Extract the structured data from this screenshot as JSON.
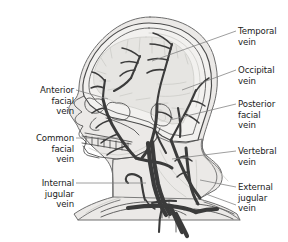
{
  "figure": {
    "view": "lateral",
    "background_color": "#ffffff",
    "colors": {
      "vein": "#3b3b3b",
      "vein_light": "#5a5a5a",
      "bone_outline": "#4a4a4a",
      "bone_fill": "#f2f1ef",
      "brain_fill": "#e6e5e2",
      "brain_line": "#c9c8c4",
      "soft_tissue_fill": "#ebe9e7",
      "soft_tissue_outline": "#6e6e6e",
      "leader_line": "#7d7d7d",
      "label_text": "#1b1b1b"
    }
  },
  "labels": {
    "left": [
      {
        "id": "anterior-facial-vein",
        "lines": [
          "Anterior",
          "facial",
          "vein"
        ],
        "text_x": 74,
        "text_y": 93,
        "leader": "M 76 90 L 108 99"
      },
      {
        "id": "common-facial-vein",
        "lines": [
          "Common",
          "facial",
          "vein"
        ],
        "text_x": 74,
        "text_y": 141,
        "leader": "M 76 138 L 118 138"
      },
      {
        "id": "internal-jugular-vein",
        "lines": [
          "Internal",
          "jugular",
          "vein"
        ],
        "text_x": 74,
        "text_y": 186,
        "leader": "M 76 183 L 146 183"
      }
    ],
    "right": [
      {
        "id": "temporal-vein",
        "lines": [
          "Temporal",
          "vein"
        ],
        "text_x": 238,
        "text_y": 34,
        "leader": "M 236 31 L 152 61"
      },
      {
        "id": "occipital-vein",
        "lines": [
          "Occipital",
          "vein"
        ],
        "text_x": 238,
        "text_y": 73,
        "leader": "M 236 70 L 182 90"
      },
      {
        "id": "posterior-facial-vein",
        "lines": [
          "Posterior",
          "facial",
          "vein"
        ],
        "text_x": 238,
        "text_y": 107,
        "leader": "M 236 104 L 170 120"
      },
      {
        "id": "vertebral-vein",
        "lines": [
          "Vertebral",
          "vein"
        ],
        "text_x": 238,
        "text_y": 154,
        "leader": "M 236 151 L 172 159"
      },
      {
        "id": "external-jugular-vein",
        "lines": [
          "External",
          "jugular",
          "vein"
        ],
        "text_x": 238,
        "text_y": 190,
        "leader": "M 236 187 L 200 180",
        "leader2": "M 236 205 L 206 194"
      }
    ]
  },
  "anatomy": {
    "head_outline_outer": "M 150 17 C 183 17 207 33 214 57 C 220 78 217 96 212 110 C 208 123 205 131 203 139 C 201 147 203 152 207 156 C 213 161 219 165 221 171 C 224 179 221 186 215 190 L 206 195 L 199 199 C 214 203 228 208 237 214 L 240 220 L 78 220 L 74 214 C 84 207 98 201 113 197 L 113 180 C 113 170 110 163 104 157 L 92 146 C 85 139 80 132 77 125 L 71 116 C 68 111 68 107 71 104 L 76 98 C 78 95 79 91 79 87 C 80 66 94 44 113 30 C 124 22 137 17 150 17 Z",
    "skull_outer": "M 149 23 C 180 23 203 39 209 62 C 214 81 211 98 207 111 C 203 123 200 132 198 140 L 186 142 L 172 141 L 162 136 L 152 128 L 140 124 L 124 120 L 110 117 L 99 112 L 90 105 L 84 96 C 82 89 83 80 86 72 C 94 47 118 23 149 23 Z",
    "skull_inner": "M 149 28 C 177 28 198 43 203 64 C 208 81 205 97 201 109 C 198 119 195 127 193 134 L 182 136 L 170 134 L 160 129 L 149 122 L 133 117 L 117 113 L 105 108 L 96 101 L 90 93 C 88 86 89 78 92 71 C 100 50 122 28 149 28 Z",
    "cranial_vault_line": "M 149 33 C 174 33 193 47 198 66 C 202 81 199 96 196 107",
    "brain": "M 146 37 C 170 36 187 48 192 66 C 196 80 193 95 190 105 C 188 112 185 118 183 123 L 172 124 L 161 120 L 150 113 L 135 108 L 120 104 L 108 99 L 99 92 L 94 84 C 93 77 94 70 97 64 C 105 46 124 37 146 37 Z",
    "brain_sulci": [
      "M 128 40 L 126 53",
      "M 140 38 L 139 52",
      "M 152 38 L 152 53",
      "M 164 41 L 165 55",
      "M 176 46 L 178 58",
      "M 185 54 L 188 64",
      "M 110 47 L 112 58",
      "M 101 58 L 106 66",
      "M 97 71 L 106 74",
      "M 100 81 L 110 81",
      "M 108 90 L 118 88",
      "M 120 96 L 132 93",
      "M 136 100 L 150 98",
      "M 154 104 L 168 103",
      "M 172 108 L 184 109",
      "M 186 82 C 178 84 168 85 158 84",
      "M 190 93 C 180 96 168 97 158 96"
    ],
    "face_profile": "M 84 96 L 78 99 C 74 101 73 104 76 107 L 82 112 C 78 114 75 117 75 120 C 76 123 79 125 83 126 L 80 131 C 78 134 79 137 83 139 L 86 142 L 84 148 C 83 152 85 155 90 156 L 99 158",
    "orbit_left": "M 93 99 C 89 97 86 98 85 102 C 84 107 87 112 93 113 C 99 114 104 111 105 106 C 106 101 101 98 96 99 Z",
    "orbit_right": "M 116 103 C 111 101 107 103 106 108 C 106 114 111 119 118 120 C 125 121 130 118 130 112 C 130 106 123 102 117 103 Z",
    "nasal": "M 96 118 C 93 120 90 123 90 127 C 91 130 95 131 99 130",
    "zygomatic": "M 106 118 C 116 121 126 125 134 130 L 139 135",
    "maxilla": "M 85 133 L 113 138 L 132 142",
    "mandible": "M 83 146 L 88 153 L 100 157 L 117 159 L 134 157 L 147 150 L 156 139 L 160 128",
    "mandible_inner": "M 89 148 L 100 153 L 118 155 L 133 153 L 145 147 L 153 138",
    "teeth_upper": "M 82 136 L 131 144",
    "teeth_lower": "M 82 143 L 130 151",
    "teeth_verticals": [
      "M 86 136 L 86 144",
      "M 92 137 L 92 145",
      "M 98 138 L 98 146",
      "M 104 139 L 104 147",
      "M 110 140 L 110 148",
      "M 116 141 L 116 149",
      "M 122 142 L 122 150",
      "M 128 143 L 128 151"
    ],
    "ear": "M 160 104 C 155 103 151 107 151 113 C 151 120 156 126 163 126 C 169 126 172 121 171 114 C 170 108 166 104 160 104 Z",
    "ear_inner": "M 160 110 C 157 110 156 113 157 116 C 158 120 161 122 164 121 C 166 120 166 116 164 113 C 163 111 162 110 160 110 Z",
    "neck_front": "M 113 159 C 112 167 113 175 113 182 L 113 197",
    "neck_back": "M 203 139 C 201 148 203 154 208 159 C 214 164 220 168 221 173",
    "scm_muscle": "M 150 152 C 155 165 163 178 175 189 L 186 197",
    "scm_muscle2": "M 160 150 C 166 164 176 177 189 187",
    "neck_tissue": "M 113 160 C 112 170 113 180 113 197 L 199 199 C 206 194 214 189 216 182 C 219 174 214 166 207 159 C 202 154 200 147 202 139 L 186 143 L 170 142 L 158 137 L 148 150 L 134 157 L 117 159 Z",
    "trapezius": "M 203 156 C 211 163 220 172 228 181",
    "clavicle_left": "M 101 212 C 116 205 136 201 155 202 C 168 203 178 206 184 210",
    "clavicle_left_b": "M 101 217 C 117 210 137 206 156 207 C 169 208 180 211 186 215",
    "clavicle_right": "M 196 204 C 210 205 224 209 234 214",
    "clavicle_right_b": "M 194 209 C 209 210 223 214 233 219",
    "thorax_line": "M 78 220 C 90 211 105 204 120 200",
    "thorax_line2": "M 240 220 C 230 212 217 206 204 202",
    "shoulder_left": "M 86 213 C 96 206 110 200 124 197",
    "sternum": "M 176 218 L 176 232",
    "trachea_l": "M 162 201 L 162 218",
    "trachea_r": "M 169 201 L 169 218",
    "spine_hint": "M 196 160 C 197 172 197 184 196 195"
  },
  "veins": {
    "superficial_temporal": "M 172 44 C 169 55 166 66 163 76 C 160 86 158 95 157 104",
    "superficial_temporal_br1": "M 172 45 C 166 39 160 35 153 33",
    "superficial_temporal_br2": "M 171 49 C 164 46 157 44 150 44",
    "superficial_temporal_br3": "M 168 60 C 161 58 154 58 148 60",
    "superficial_temporal_br4": "M 165 70 C 158 69 152 70 147 73",
    "frontal_trunk": "M 140 56 C 137 64 134 71 131 78",
    "frontal_br1": "M 140 57 C 134 52 128 49 122 48",
    "frontal_br2": "M 138 63 C 132 61 126 61 121 63",
    "frontal_br3": "M 135 70 C 129 70 124 72 120 76",
    "supraorbital": "M 131 78 C 126 84 120 88 114 91",
    "angular_vein": "M 105 80 C 104 87 103 93 103 99",
    "angular_br1": "M 105 81 C 101 76 97 73 92 72",
    "angular_br2": "M 104 88 C 100 86 95 86 91 88",
    "anterior_facial_main": "M 103 99 C 105 110 110 122 117 133 C 124 144 130 152 136 158",
    "anterior_facial_br1": "M 106 108 C 101 108 96 110 92 113",
    "anterior_facial_br2": "M 111 120 C 106 121 100 124 96 128",
    "anterior_facial_br3": "M 118 134 C 112 136 106 139 101 143",
    "anterior_facial_br4": "M 126 146 C 119 148 112 151 107 155",
    "posterior_facial": "M 157 104 C 157 115 156 126 153 136 C 151 145 147 152 142 158",
    "posterior_facial_br": "M 158 112 C 163 112 168 114 172 118",
    "retromandibular": "M 155 130 C 158 138 162 146 166 153",
    "common_facial": "M 136 158 C 142 160 149 161 155 162 C 162 163 168 165 172 168",
    "common_facial_label_pt": "M 128 151 L 136 158",
    "occipital_vein": "M 196 90 C 192 100 187 110 182 119 C 178 127 174 134 171 140",
    "occipital_br1": "M 196 91 C 200 85 204 81 209 78",
    "occipital_br2": "M 191 101 C 196 101 201 103 205 106",
    "occipital_br3": "M 185 114 C 190 116 195 119 199 123",
    "posterior_auricular": "M 178 108 C 180 118 181 128 180 137",
    "external_jugular": "M 171 140 C 175 152 180 164 186 176 C 191 186 196 193 200 198",
    "external_jugular_br": "M 178 158 C 183 157 188 158 192 161",
    "internal_jugular": "M 152 142 C 153 156 155 170 158 184 C 161 196 165 206 170 214",
    "internal_jugular_wide": "M 148 143 C 149 157 151 171 154 185 C 157 197 161 207 166 215",
    "vertebral_vein": "M 186 148 C 187 160 188 172 190 183 C 192 192 195 199 198 204",
    "vertebral_br1": "M 187 156 C 182 156 178 158 175 161",
    "vertebral_br2": "M 189 172 C 184 172 180 174 177 177",
    "subclavian_left": "M 128 208 C 142 206 156 205 170 206 C 180 207 189 209 196 212",
    "subclavian_right": "M 196 212 C 203 210 210 209 217 209",
    "brachiocephalic": "M 170 206 C 174 214 178 223 182 232",
    "brachiocephalic2": "M 162 207 C 160 215 159 224 159 232",
    "svc": "M 176 214 C 180 222 184 229 187 236",
    "thyroid_vein": "M 146 200 C 148 204 151 207 155 209",
    "jugular_arch": "M 152 203 C 160 201 168 200 176 201",
    "anterior_jugular": "M 141 178 C 142 186 143 194 145 200",
    "anterior_jugular_hook": "M 141 178 C 136 174 132 173 128 175 C 125 177 125 181 128 183"
  }
}
